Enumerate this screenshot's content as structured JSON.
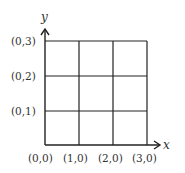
{
  "diagram": {
    "type": "coordinate-grid",
    "axes": {
      "x_label": "x",
      "y_label": "y"
    },
    "grid": {
      "cols": 3,
      "rows": 3
    },
    "x_tick_labels": [
      "(0,0)",
      "(1,0)",
      "(2,0)",
      "(3,0)"
    ],
    "y_tick_labels": [
      "(0,1)",
      "(0,2)",
      "(0,3)"
    ],
    "colors": {
      "line": "#222222",
      "text": "#333333",
      "background": "#ffffff"
    }
  }
}
